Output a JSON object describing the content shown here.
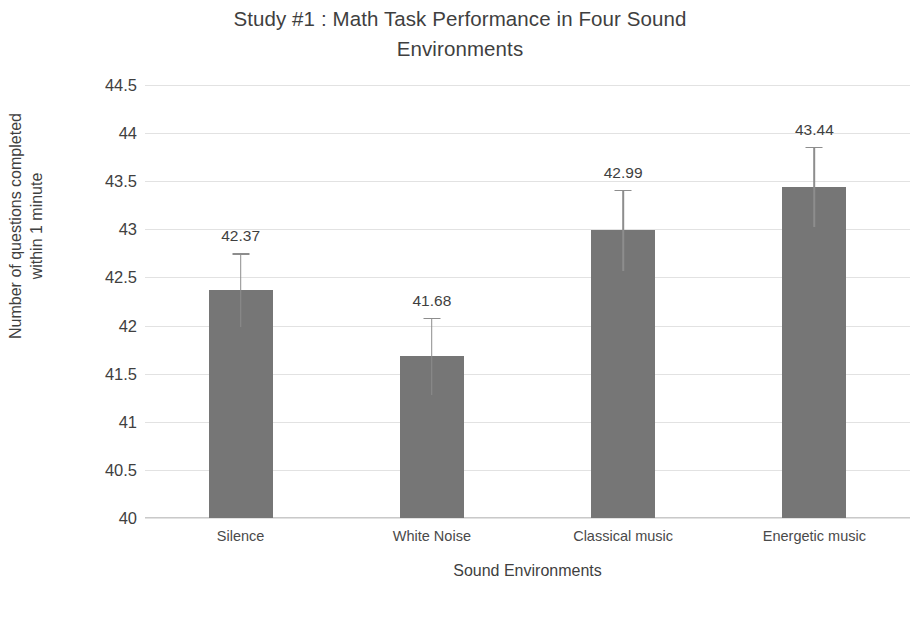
{
  "chart_data": {
    "type": "bar",
    "title": "Study #1 : Math Task Performance in Four Sound Environments",
    "title_line1": "Study #1 : Math Task Performance in Four Sound",
    "title_line2": "Environments",
    "xlabel": "Sound Environments",
    "ylabel": "Number of questions completed within 1 minute",
    "ylabel_line1": "Number of questions completed",
    "ylabel_line2": "within 1 minute",
    "categories": [
      "Silence",
      "White Noise",
      "Classical music",
      "Energetic music"
    ],
    "values": [
      42.37,
      41.68,
      42.99,
      43.44
    ],
    "value_labels": [
      "42.37",
      "41.68",
      "42.99",
      "43.44"
    ],
    "errors": [
      0.38,
      0.4,
      0.42,
      0.42
    ],
    "ylim": [
      40,
      44.5
    ],
    "ytick_step": 0.5,
    "yticks": [
      "44.5",
      "44",
      "43.5",
      "43",
      "42.5",
      "42",
      "41.5",
      "41",
      "40.5",
      "40"
    ],
    "ytick_values": [
      44.5,
      44,
      43.5,
      43,
      42.5,
      42,
      41.5,
      41,
      40.5,
      40
    ],
    "grid": true,
    "legend": "none",
    "bar_color": "#767676",
    "error_bar_color": "#8d8d8d",
    "gridline_color": "#e2e2e2",
    "text_color": "#3f3f3f",
    "background_color": "#ffffff"
  }
}
